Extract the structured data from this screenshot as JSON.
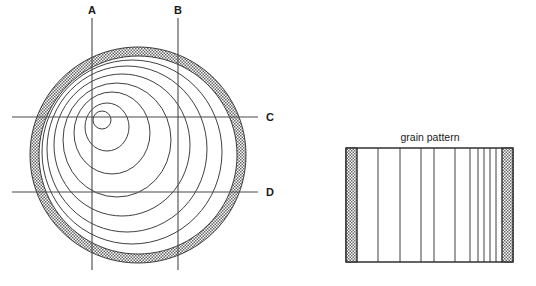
{
  "figure": {
    "background_color": "#ffffff",
    "line_color": "#2a2a2a",
    "cut_line_color": "#4a4a4a",
    "stipple_color": "#555555"
  },
  "log_panel": {
    "name": "log-cross-section",
    "center": {
      "x": 138,
      "y": 155
    },
    "bark": {
      "outer_radius": 108,
      "inner_radius": 99,
      "label": "bark",
      "pattern": "stipple"
    },
    "pith": {
      "x": 102,
      "y": 120,
      "radius": 9
    },
    "growth_rings": [
      {
        "index": 1,
        "cx": 107,
        "cy": 127,
        "rx": 22,
        "ry": 24
      },
      {
        "index": 2,
        "cx": 112,
        "cy": 133,
        "rx": 38,
        "ry": 41
      },
      {
        "index": 3,
        "cx": 117,
        "cy": 140,
        "rx": 54,
        "ry": 57
      },
      {
        "index": 4,
        "cx": 122,
        "cy": 145,
        "rx": 68,
        "ry": 71
      },
      {
        "index": 5,
        "cx": 127,
        "cy": 149,
        "rx": 80,
        "ry": 83
      },
      {
        "index": 6,
        "cx": 132,
        "cy": 152,
        "rx": 90,
        "ry": 92
      }
    ],
    "cut_lines": [
      {
        "id": "A",
        "label": "A",
        "orientation": "vertical",
        "x": 92,
        "y1": 18,
        "y2": 270,
        "label_x": 92,
        "label_y": 14
      },
      {
        "id": "B",
        "label": "B",
        "orientation": "vertical",
        "x": 178,
        "y1": 18,
        "y2": 270,
        "label_x": 178,
        "label_y": 14
      },
      {
        "id": "C",
        "label": "C",
        "orientation": "horizontal",
        "y": 117,
        "x1": 12,
        "x2": 258,
        "label_x": 266,
        "label_y": 121
      },
      {
        "id": "D",
        "label": "D",
        "orientation": "horizontal",
        "y": 192,
        "x1": 12,
        "x2": 258,
        "label_x": 266,
        "label_y": 196
      }
    ]
  },
  "board_panel": {
    "name": "grain-pattern-board",
    "title": "grain pattern",
    "title_x": 430,
    "title_y": 141,
    "rect": {
      "x": 346,
      "y": 148,
      "width": 167,
      "height": 114
    },
    "bark_edges": [
      {
        "side": "left",
        "x": 346,
        "width": 11,
        "pattern": "stipple"
      },
      {
        "side": "right",
        "x": 502,
        "width": 11,
        "pattern": "stipple"
      }
    ],
    "grain_lines_x": [
      357,
      378,
      400,
      421,
      434,
      455,
      470,
      478,
      484,
      490,
      496,
      502
    ]
  }
}
